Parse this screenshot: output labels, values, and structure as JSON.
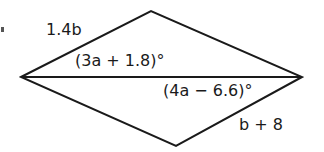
{
  "diagram": {
    "type": "rhombus-with-diagonal",
    "vertices": {
      "left": [
        21,
        77
      ],
      "top": [
        151,
        11
      ],
      "right": [
        302,
        77
      ],
      "bottom": [
        176,
        146
      ]
    },
    "stroke_color": "#1a1a1a",
    "labels": {
      "top_left_side": "1.4b",
      "bottom_right_side": "b + 8",
      "angle_left_upper": "(3a + 1.8)°",
      "angle_right_lower": "(4a − 6.6)°"
    }
  }
}
